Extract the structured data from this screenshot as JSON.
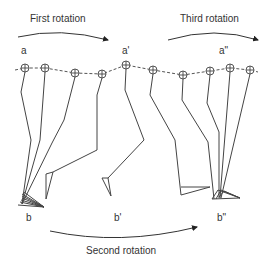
{
  "diagram": {
    "type": "gait-sequence",
    "rotations": {
      "first": "First rotation",
      "second": "Second rotation",
      "third": "Third rotation"
    },
    "points": {
      "a": "a",
      "a1": "a'",
      "a2": "a\"",
      "b": "b",
      "b1": "b'",
      "b2": "b\""
    },
    "line_color": "#444444",
    "hip_markers": [
      [
        25,
        68
      ],
      [
        45,
        68
      ],
      [
        75,
        73
      ],
      [
        102,
        74
      ],
      [
        126,
        65
      ],
      [
        153,
        70
      ],
      [
        183,
        75
      ],
      [
        210,
        71
      ],
      [
        230,
        68
      ],
      [
        250,
        70
      ]
    ]
  }
}
